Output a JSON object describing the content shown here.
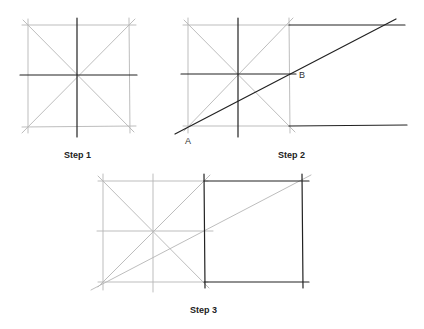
{
  "figure": {
    "steps": [
      {
        "label": "Step 1"
      },
      {
        "label": "Step 2",
        "points": {
          "a": "A",
          "b": "B"
        }
      },
      {
        "label": "Step 3"
      }
    ]
  },
  "colors": {
    "light_line": "#b8b8b8",
    "dark_line": "#222222"
  }
}
